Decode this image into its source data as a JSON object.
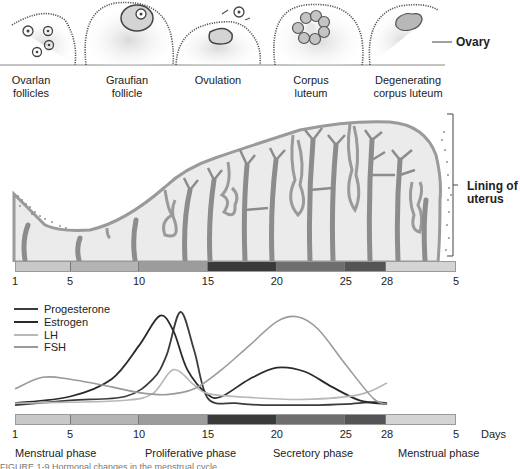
{
  "ovary": {
    "label": "Ovary",
    "stages": [
      {
        "line1": "Ovarlan",
        "line2": "follicles"
      },
      {
        "line1": "Graufian",
        "line2": "follicle"
      },
      {
        "line1": "Ovulation",
        "line2": ""
      },
      {
        "line1": "Corpus",
        "line2": "luteum"
      },
      {
        "line1": "Degenerating",
        "line2": "corpus luteum"
      }
    ]
  },
  "uterus": {
    "label_line1": "Lining of",
    "label_line2": "uterus"
  },
  "day_ticks": [
    "1",
    "5",
    "10",
    "15",
    "20",
    "25",
    "28",
    "5"
  ],
  "days_label": "Days",
  "phases": [
    "Menstrual phase",
    "Proliferative phase",
    "Secretory phase",
    "Menstrual phase"
  ],
  "bar_segments": [
    {
      "from": 1,
      "to": 5,
      "color": "#c8c8c8"
    },
    {
      "from": 5,
      "to": 10,
      "color": "#b4b4b4"
    },
    {
      "from": 10,
      "to": 15,
      "color": "#9c9c9c"
    },
    {
      "from": 15,
      "to": 20,
      "color": "#3a3a3a"
    },
    {
      "from": 20,
      "to": 25,
      "color": "#6e6e6e"
    },
    {
      "from": 25,
      "to": 28,
      "color": "#545454"
    },
    {
      "from": 28,
      "to": 33,
      "color": "#d4d4d4"
    }
  ],
  "colors": {
    "progesterone": "#3c3c3c",
    "estrogen": "#2a2a2a",
    "lh": "#b8b8b8",
    "fsh": "#9a9a9a",
    "tissue_fill": "#e8e8e8",
    "tissue_stroke": "#9a9a9a",
    "vessel": "#8c8c8c"
  },
  "chart_data": {
    "type": "line",
    "title": "",
    "xlabel": "Days",
    "ylabel": "",
    "x_ticks": [
      "1",
      "5",
      "10",
      "15",
      "20",
      "25",
      "28",
      "5"
    ],
    "xlim": [
      1,
      33
    ],
    "ylim": [
      0,
      100
    ],
    "legend_position": "top-left",
    "series": [
      {
        "name": "Progesterone",
        "x": [
          1,
          5,
          9,
          11,
          12,
          13,
          14,
          15,
          17,
          19,
          21,
          23,
          25,
          27,
          28
        ],
        "y": [
          3,
          8,
          12,
          30,
          55,
          100,
          60,
          10,
          5,
          3,
          3,
          3,
          4,
          6,
          5
        ]
      },
      {
        "name": "Estrogen",
        "x": [
          1,
          5,
          8,
          10,
          11.5,
          12.5,
          13.5,
          15,
          16,
          18,
          20,
          22,
          24,
          26,
          28
        ],
        "y": [
          5,
          12,
          30,
          65,
          96,
          80,
          40,
          14,
          12,
          30,
          42,
          38,
          22,
          8,
          4
        ]
      },
      {
        "name": "LH",
        "x": [
          1,
          5,
          9,
          11,
          12.5,
          14,
          15,
          18,
          22,
          26,
          28
        ],
        "y": [
          5,
          6,
          8,
          15,
          40,
          24,
          15,
          11,
          9,
          14,
          26
        ]
      },
      {
        "name": "FSH",
        "x": [
          1,
          3,
          5,
          8,
          10,
          12,
          14,
          16,
          18,
          20,
          21.5,
          23,
          25,
          27,
          28
        ],
        "y": [
          20,
          32,
          30,
          22,
          16,
          14,
          20,
          40,
          65,
          90,
          95,
          82,
          45,
          10,
          4
        ]
      }
    ]
  },
  "caption_partial": "FIGURE 1-9  Hormonal changes in the menstrual cycle"
}
